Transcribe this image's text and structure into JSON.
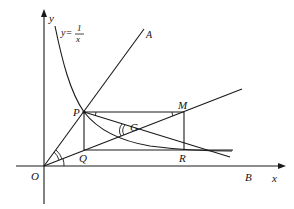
{
  "diagram": {
    "type": "geometry-figure",
    "curve_label": {
      "prefix": "y=",
      "numerator": "1",
      "denominator": "x"
    },
    "axes": {
      "x_label": "x",
      "y_label": "y",
      "origin_label": "O"
    },
    "points": {
      "O": "O",
      "A": "A",
      "B": "B",
      "P": "P",
      "Q": "Q",
      "M": "M",
      "R": "R",
      "G": "G"
    },
    "segments": [
      "OA",
      "OM",
      "PM",
      "PQ",
      "MR",
      "QR",
      "PR",
      "OB"
    ],
    "curves": [
      "y=1/x"
    ],
    "angle_marks": [
      "angle AOM",
      "angle MOB",
      "angle MPR",
      "angle PMO",
      "angle PGO"
    ]
  }
}
